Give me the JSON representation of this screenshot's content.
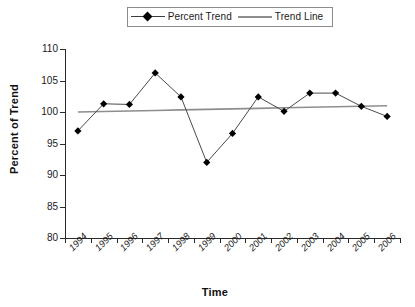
{
  "chart_data": {
    "type": "line",
    "title": "",
    "xlabel": "Time",
    "ylabel": "Percent of Trend",
    "categories": [
      "1994",
      "1995",
      "1996",
      "1997",
      "1998",
      "1999",
      "2000",
      "2001",
      "2002",
      "2003",
      "2004",
      "2005",
      "2006"
    ],
    "series": [
      {
        "name": "Percent Trend",
        "marker": "diamond",
        "color": "#000000",
        "values": [
          97.0,
          101.3,
          101.2,
          106.2,
          102.4,
          92.0,
          96.6,
          102.4,
          100.1,
          103.0,
          103.0,
          100.9,
          99.3
        ]
      },
      {
        "name": "Trend Line",
        "marker": "none",
        "color": "#8e8e8e",
        "values": [
          100.0,
          100.08,
          100.17,
          100.25,
          100.33,
          100.42,
          100.5,
          100.58,
          100.67,
          100.75,
          100.83,
          100.92,
          101.0
        ]
      }
    ],
    "ylim": [
      80,
      110
    ],
    "yticks": [
      110,
      105,
      100,
      95,
      90,
      85,
      80
    ],
    "ytick_labels": [
      "110",
      "105",
      "100",
      "95",
      "90",
      "85",
      "80"
    ],
    "grid": false,
    "legend_position": "top-center"
  },
  "legend": {
    "entries": [
      {
        "label": "Percent Trend"
      },
      {
        "label": "Trend Line"
      }
    ]
  },
  "axes": {
    "y_title": "Percent of Trend",
    "x_title": "Time"
  }
}
